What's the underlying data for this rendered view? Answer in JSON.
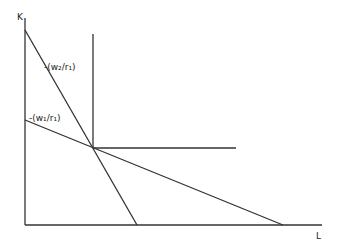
{
  "diagram": {
    "type": "isoquant-isocost",
    "axes": {
      "y_label": "K",
      "x_label": "L",
      "origin": [
        25,
        225
      ],
      "y_top": [
        25,
        18
      ],
      "x_right": [
        322,
        225
      ]
    },
    "isoquant": {
      "shape": "L-shaped (fixed proportions)",
      "corner": [
        93,
        148
      ],
      "vertical_top": [
        93,
        34
      ],
      "horizontal_right": [
        236,
        148
      ]
    },
    "isocost_lines": [
      {
        "label": "-(w₂/r₁)",
        "start": [
          25,
          30
        ],
        "end": [
          137,
          225
        ],
        "label_pos": [
          44,
          70
        ]
      },
      {
        "label": "-(w₁/r₁)",
        "start": [
          25,
          120
        ],
        "end": [
          283,
          225
        ],
        "label_pos": [
          29,
          121
        ]
      }
    ],
    "line_color": "#333333"
  }
}
